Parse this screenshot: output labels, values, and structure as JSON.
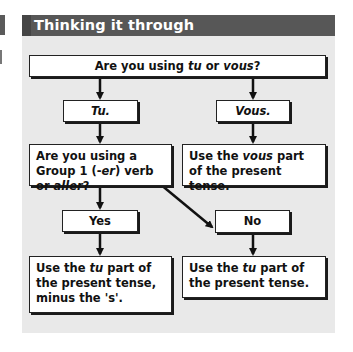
{
  "header": {
    "title": "Thinking it through"
  },
  "flowchart": {
    "question_1": {
      "parts": [
        "Are you using ",
        "tu",
        " or ",
        "vous",
        "?"
      ]
    },
    "branch_tu": {
      "label": "Tu."
    },
    "branch_vous": {
      "label": "Vous."
    },
    "question_2": {
      "parts": [
        "Are you using a Group 1 (-",
        "er",
        ") verb or ",
        "aller",
        "?"
      ]
    },
    "answer_vous": {
      "parts": [
        "Use the ",
        "vous",
        " part of the present tense."
      ]
    },
    "branch_yes": {
      "label": "Yes"
    },
    "branch_no": {
      "label": "No"
    },
    "answer_yes": {
      "parts": [
        "Use the ",
        "tu",
        " part of the present tense, minus the 's'."
      ]
    },
    "answer_no": {
      "parts": [
        "Use the ",
        "tu",
        " part of the present tense."
      ]
    }
  },
  "colors": {
    "header_bg": "#575757",
    "panel_bg": "#e9e9e9",
    "box_bg": "#ffffff",
    "line": "#111111"
  }
}
